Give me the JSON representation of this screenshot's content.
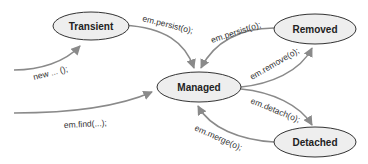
{
  "diagram": {
    "states": {
      "transient": "Transient",
      "managed": "Managed",
      "removed": "Removed",
      "detached": "Detached"
    },
    "transitions": [
      {
        "from": "",
        "to": "Transient",
        "label": "new ... ();"
      },
      {
        "from": "",
        "to": "Managed",
        "label": "em.find(...);"
      },
      {
        "from": "Transient",
        "to": "Managed",
        "label": "em.persist(o);"
      },
      {
        "from": "Removed",
        "to": "Managed",
        "label": "em.persist(o);"
      },
      {
        "from": "Managed",
        "to": "Removed",
        "label": "em.remove(o);"
      },
      {
        "from": "Managed",
        "to": "Detached",
        "label": "em.detach(o);"
      },
      {
        "from": "Detached",
        "to": "Managed",
        "label": "em.merge(o);"
      }
    ],
    "colors": {
      "node_fill": "#eeeeee",
      "node_stroke": "#333333",
      "edge": "#8a8a8a"
    }
  }
}
